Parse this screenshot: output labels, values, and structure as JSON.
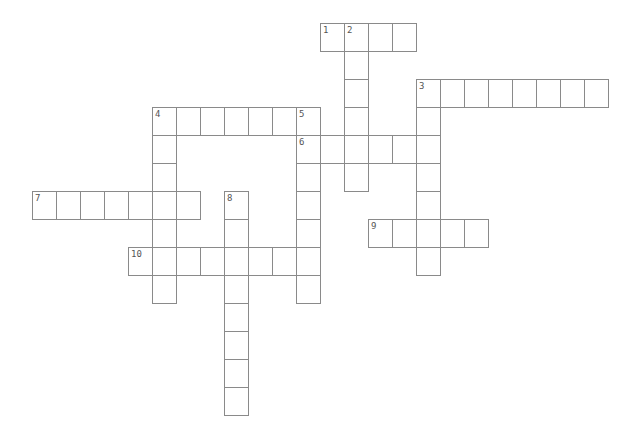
{
  "puzzle": {
    "cell_w": 24,
    "cell_h": 28,
    "line_color": "#8a8a8a",
    "number_color": "#555555",
    "entries": [
      {
        "number": "1",
        "direction": "across",
        "x": 320,
        "y": 23,
        "length": 4
      },
      {
        "number": "2",
        "direction": "down",
        "x": 344,
        "y": 23,
        "length": 6
      },
      {
        "number": "3",
        "direction": "across",
        "x": 416,
        "y": 79,
        "length": 8
      },
      {
        "number": "3",
        "direction": "down",
        "x": 416,
        "y": 79,
        "length": 7
      },
      {
        "number": "4",
        "direction": "across",
        "x": 152,
        "y": 107,
        "length": 7
      },
      {
        "number": "4",
        "direction": "down",
        "x": 152,
        "y": 107,
        "length": 7
      },
      {
        "number": "5",
        "direction": "down",
        "x": 296,
        "y": 107,
        "length": 7
      },
      {
        "number": "6",
        "direction": "across",
        "x": 296,
        "y": 135,
        "length": 6
      },
      {
        "number": "7",
        "direction": "across",
        "x": 32,
        "y": 191,
        "length": 7
      },
      {
        "number": "8",
        "direction": "down",
        "x": 224,
        "y": 191,
        "length": 8
      },
      {
        "number": "9",
        "direction": "across",
        "x": 368,
        "y": 219,
        "length": 5
      },
      {
        "number": "10",
        "direction": "across",
        "x": 128,
        "y": 247,
        "length": 8
      }
    ]
  }
}
